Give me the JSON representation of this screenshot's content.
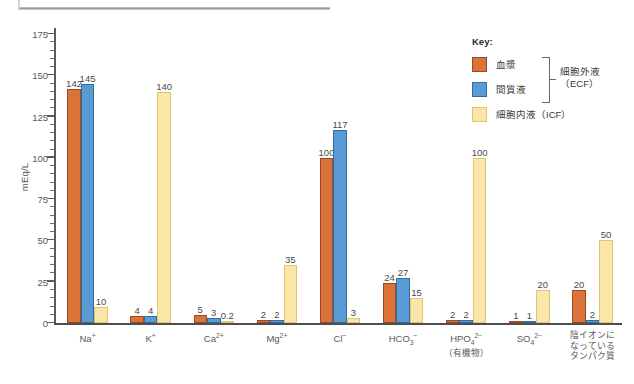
{
  "chart_data": {
    "type": "bar",
    "title": "",
    "xlabel": "",
    "ylabel": "mEq/L",
    "ylim": [
      0,
      175
    ],
    "ytick_step": 25,
    "yminor_step": 5,
    "grid": false,
    "legend_position": "top-right",
    "yticks": [
      "175",
      "150",
      "125",
      "100",
      "75",
      "50",
      "25",
      "0"
    ],
    "categories": [
      {
        "key": "na",
        "main": "Na",
        "sup": "+",
        "sub": "",
        "note": ""
      },
      {
        "key": "k",
        "main": "K",
        "sup": "+",
        "sub": "",
        "note": ""
      },
      {
        "key": "ca",
        "main": "Ca",
        "sup": "2+",
        "sub": "",
        "note": ""
      },
      {
        "key": "mg",
        "main": "Mg",
        "sup": "2+",
        "sub": "",
        "note": ""
      },
      {
        "key": "cl",
        "main": "Cl",
        "sup": "−",
        "sub": "",
        "note": ""
      },
      {
        "key": "hco3",
        "main": "HCO",
        "sup": "−",
        "sub": "3",
        "note": ""
      },
      {
        "key": "hpo4",
        "main": "HPO",
        "sup": "2−",
        "sub": "4",
        "note": "（有機物）"
      },
      {
        "key": "so4",
        "main": "SO",
        "sup": "2−",
        "sub": "4",
        "note": ""
      },
      {
        "key": "prot",
        "main": "",
        "sup": "",
        "sub": "",
        "note": "",
        "multiline": [
          "陰イオンに",
          "なっている",
          "タンパク質"
        ]
      }
    ],
    "series": [
      {
        "name": "血漿",
        "key": "plasma",
        "color": "#d9733a",
        "values": [
          142,
          4,
          5,
          2,
          100,
          24,
          2,
          1,
          20
        ],
        "labels": [
          "142",
          "4",
          "5",
          "2",
          "100",
          "24",
          "2",
          "1",
          "20"
        ]
      },
      {
        "name": "間質液",
        "key": "interstitial",
        "color": "#5b9bd5",
        "values": [
          145,
          4,
          3,
          2,
          117,
          27,
          2,
          1,
          2
        ],
        "labels": [
          "145",
          "4",
          "3",
          "2",
          "117",
          "27",
          "2",
          "1",
          "2"
        ]
      },
      {
        "name": "細胞内液（ICF）",
        "key": "icf",
        "color": "#fae6a8",
        "values": [
          10,
          140,
          0.2,
          35,
          3,
          15,
          100,
          20,
          50
        ],
        "labels": [
          "10",
          "140",
          "0.2",
          "35",
          "3",
          "15",
          "100",
          "20",
          "50"
        ]
      }
    ]
  },
  "legend": {
    "title": "Key:",
    "items": [
      {
        "label": "血漿",
        "key": "plasma"
      },
      {
        "label": "間質液",
        "key": "interstitial"
      },
      {
        "label": "細胞内液（ICF）",
        "key": "icf"
      }
    ],
    "bracket_label_line1": "細胞外液",
    "bracket_label_line2": "（ECF）"
  },
  "colors": {
    "plasma": "#d9733a",
    "plasma_border": "#9d4a20",
    "interstitial": "#5b9bd5",
    "interstitial_border": "#2f6da8",
    "icf": "#fae6a8",
    "icf_border": "#e2c571",
    "axis": "#4d4d4d",
    "text": "#58595b"
  }
}
